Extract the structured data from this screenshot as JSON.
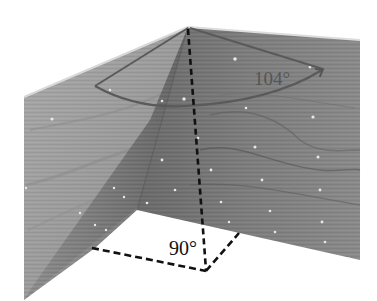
{
  "figure": {
    "annotations": {
      "top_angle": {
        "value": "104",
        "unit": "°",
        "text": "104°",
        "color": "#555555"
      },
      "base_angle": {
        "value": "90",
        "unit": "°",
        "text": "90°",
        "color": "#111111"
      }
    },
    "colors": {
      "background": "#ffffff",
      "left_panel": "#9a9a9a",
      "fin_panel": "#6e6e6e",
      "right_panel": "#7c7c7c",
      "dashed_line": "#111111",
      "arc": "#5a5a5a",
      "dots": "#e8e8e8"
    }
  }
}
